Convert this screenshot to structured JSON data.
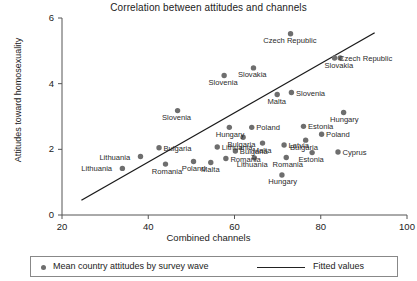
{
  "chart_data": {
    "type": "scatter",
    "title": "Correlation between attitudes and channels",
    "xlabel": "Combined channels",
    "ylabel": "Attitudes toward homosexuality",
    "xlim": [
      20,
      100
    ],
    "ylim": [
      0,
      6
    ],
    "xticks": [
      20,
      40,
      60,
      80,
      100
    ],
    "yticks": [
      0,
      2,
      4,
      6
    ],
    "grid": false,
    "legend_position": "bottom",
    "legend": [
      {
        "marker": "dot",
        "label": "Mean country attitudes by survey wave"
      },
      {
        "marker": "line",
        "label": "Fitted values"
      }
    ],
    "fit_line": {
      "x0": 24.5,
      "y0": 0.45,
      "x1": 92.5,
      "y1": 5.55
    },
    "points": [
      {
        "label": "Czech Republic",
        "x": 73.0,
        "y": 5.52,
        "lx": "below"
      },
      {
        "label": "Czech Republic",
        "x": 83.2,
        "y": 4.78,
        "lx": "right"
      },
      {
        "label": "Slovakia",
        "x": 84.5,
        "y": 4.78,
        "lx": "below"
      },
      {
        "label": "Slovakia",
        "x": 64.4,
        "y": 4.48,
        "lx": "below"
      },
      {
        "label": "Slovenia",
        "x": 57.6,
        "y": 4.25,
        "lx": "below"
      },
      {
        "label": "Slovenia",
        "x": 73.2,
        "y": 3.73,
        "lx": "right"
      },
      {
        "label": "Malta",
        "x": 69.9,
        "y": 3.67,
        "lx": "below"
      },
      {
        "label": "Slovenia",
        "x": 46.8,
        "y": 3.18,
        "lx": "below"
      },
      {
        "label": "Hungary",
        "x": 85.3,
        "y": 3.12,
        "lx": "below"
      },
      {
        "label": "Hungary",
        "x": 58.8,
        "y": 2.67,
        "lx": "below"
      },
      {
        "label": "Poland",
        "x": 64.0,
        "y": 2.67,
        "lx": "right"
      },
      {
        "label": "Estonia",
        "x": 76.0,
        "y": 2.7,
        "lx": "right"
      },
      {
        "label": "Poland",
        "x": 80.2,
        "y": 2.46,
        "lx": "right"
      },
      {
        "label": "Bulgaria",
        "x": 62.0,
        "y": 2.37,
        "lx": "below"
      },
      {
        "label": "Bulgaria",
        "x": 76.5,
        "y": 2.28,
        "lx": "below"
      },
      {
        "label": "Malta",
        "x": 66.5,
        "y": 2.19,
        "lx": "below"
      },
      {
        "label": "Latvia",
        "x": 71.5,
        "y": 2.13,
        "lx": "right"
      },
      {
        "label": "Bulgaria",
        "x": 42.5,
        "y": 2.05,
        "lx": "right"
      },
      {
        "label": "Lithuania",
        "x": 56.0,
        "y": 2.07,
        "lx": "right"
      },
      {
        "label": "Bulgaria",
        "x": 60.2,
        "y": 1.95,
        "lx": "right"
      },
      {
        "label": "Cyprus",
        "x": 84.0,
        "y": 1.92,
        "lx": "right"
      },
      {
        "label": "Estonia",
        "x": 78.0,
        "y": 1.9,
        "lx": "below"
      },
      {
        "label": "Lithuania",
        "x": 38.2,
        "y": 1.78,
        "lx": "left"
      },
      {
        "label": "Lithuania",
        "x": 64.6,
        "y": 1.74,
        "lx": "below"
      },
      {
        "label": "Romania",
        "x": 72.0,
        "y": 1.75,
        "lx": "below"
      },
      {
        "label": "Romania",
        "x": 58.0,
        "y": 1.72,
        "lx": "right"
      },
      {
        "label": "Poland",
        "x": 50.5,
        "y": 1.63,
        "lx": "below"
      },
      {
        "label": "Malta",
        "x": 54.5,
        "y": 1.6,
        "lx": "below"
      },
      {
        "label": "Romania",
        "x": 44.0,
        "y": 1.55,
        "lx": "below"
      },
      {
        "label": "Lithuania",
        "x": 34.0,
        "y": 1.42,
        "lx": "left"
      },
      {
        "label": "Hungary",
        "x": 71.0,
        "y": 1.22,
        "lx": "below"
      }
    ]
  }
}
